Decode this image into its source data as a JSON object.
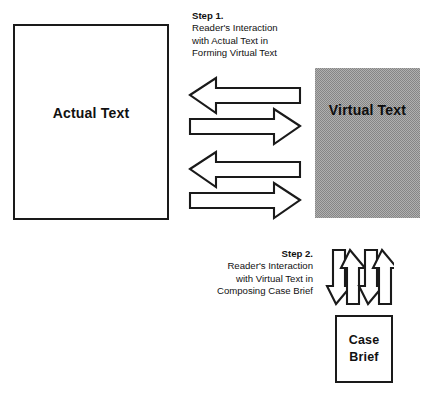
{
  "diagram": {
    "background_color": "#ffffff",
    "line_color": "#1a1a1a",
    "texture_color": "#9a9a9a"
  },
  "boxes": {
    "actual_text": {
      "label": "Actual Text",
      "fill": "white",
      "border": "#1a1a1a"
    },
    "virtual_text": {
      "label": "Virtual Text",
      "fill": "gray-halftone-texture",
      "border": "none"
    },
    "case_brief": {
      "label_line1": "Case",
      "label_line2": "Brief",
      "fill": "white",
      "border": "#1a1a1a"
    }
  },
  "captions": {
    "step1": {
      "step": "Step 1.",
      "line1": "Reader's Interaction",
      "line2": "with Actual Text in",
      "line3": "Forming Virtual Text",
      "align": "left"
    },
    "step2": {
      "step": "Step 2.",
      "line1": "Reader's Interaction",
      "line2": "with Virtual Text in",
      "line3": "Composing Case Brief",
      "align": "right"
    }
  },
  "arrows": {
    "horizontal_group": {
      "name": "step1-bidirectional-arrows",
      "count": 4,
      "directions": [
        "left",
        "right",
        "left",
        "right"
      ]
    },
    "vertical_group": {
      "name": "step2-bidirectional-arrows",
      "count": 4,
      "directions": [
        "down",
        "up",
        "down",
        "up"
      ]
    }
  }
}
